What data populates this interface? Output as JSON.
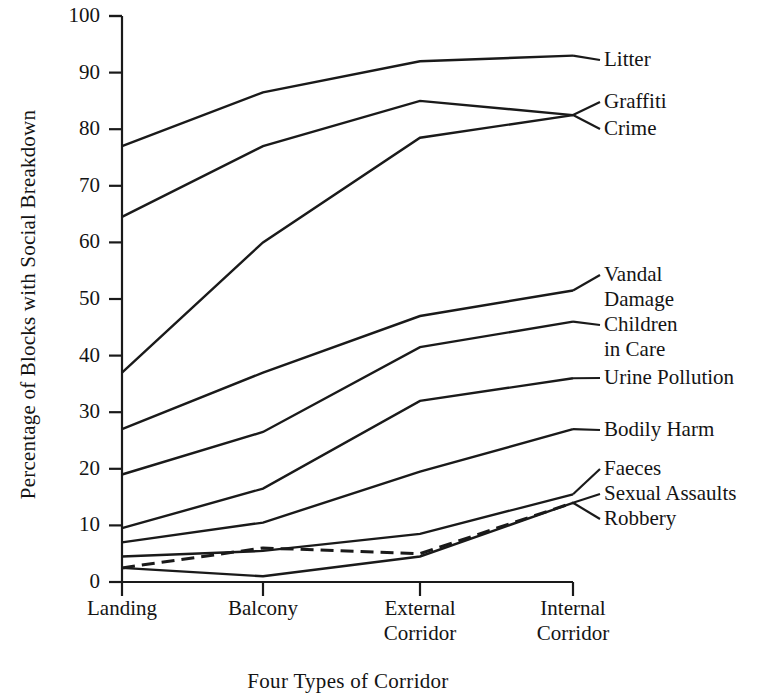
{
  "chart_data": {
    "type": "line",
    "title": "",
    "xlabel": "Four Types of Corridor",
    "ylabel": "Percentage of Blocks with Social Breakdown",
    "categories": [
      "Landing",
      "Balcony",
      "External Corridor",
      "Internal Corridor"
    ],
    "category_lines": [
      [
        "Landing"
      ],
      [
        "Balcony"
      ],
      [
        "External",
        "Corridor"
      ],
      [
        "Internal",
        "Corridor"
      ]
    ],
    "ylim": [
      0,
      100
    ],
    "yticks": [
      0,
      10,
      20,
      30,
      40,
      50,
      60,
      70,
      80,
      90,
      100
    ],
    "ytick_labels": [
      "0",
      "10",
      "20",
      "30",
      "40",
      "50",
      "60",
      "70",
      "80",
      "90",
      "100"
    ],
    "grid": false,
    "legend_position": "right-inline-labels",
    "line_color": "#1a1a1a",
    "series": [
      {
        "name": "Litter",
        "label_lines": [
          "Litter"
        ],
        "style": "solid",
        "values": [
          77,
          86.5,
          92,
          93
        ],
        "label_y": 47
      },
      {
        "name": "Graffiti",
        "label_lines": [
          "Graffiti"
        ],
        "style": "solid",
        "values": [
          64.5,
          77,
          85,
          82.5
        ],
        "label_y": 89
      },
      {
        "name": "Crime",
        "label_lines": [
          "Crime"
        ],
        "style": "solid",
        "values": [
          37,
          60,
          78.5,
          82.5
        ],
        "label_y": 116
      },
      {
        "name": "Vandal Damage",
        "label_lines": [
          "Vandal",
          "Damage"
        ],
        "style": "solid",
        "values": [
          27,
          37,
          47,
          51.5
        ],
        "label_y": 262
      },
      {
        "name": "Children in Care",
        "label_lines": [
          "Children",
          "in Care"
        ],
        "style": "solid",
        "values": [
          19,
          26.5,
          41.5,
          46
        ],
        "label_y": 312
      },
      {
        "name": "Urine Pollution",
        "label_lines": [
          "Urine Pollution"
        ],
        "style": "solid",
        "values": [
          9.5,
          16.5,
          32,
          36
        ],
        "label_y": 365
      },
      {
        "name": "Bodily Harm",
        "label_lines": [
          "Bodily Harm"
        ],
        "style": "solid",
        "values": [
          7,
          10.5,
          19.5,
          27
        ],
        "label_y": 417
      },
      {
        "name": "Faeces",
        "label_lines": [
          "Faeces"
        ],
        "style": "solid",
        "values": [
          4.5,
          5.5,
          8.5,
          15.5
        ],
        "label_y": 456
      },
      {
        "name": "Sexual Assaults",
        "label_lines": [
          "Sexual Assaults"
        ],
        "style": "dashed",
        "values": [
          2.5,
          6,
          5,
          14
        ],
        "label_y": 481
      },
      {
        "name": "Robbery",
        "label_lines": [
          "Robbery"
        ],
        "style": "solid",
        "values": [
          2.5,
          1,
          4.5,
          14
        ],
        "label_y": 506
      }
    ]
  }
}
